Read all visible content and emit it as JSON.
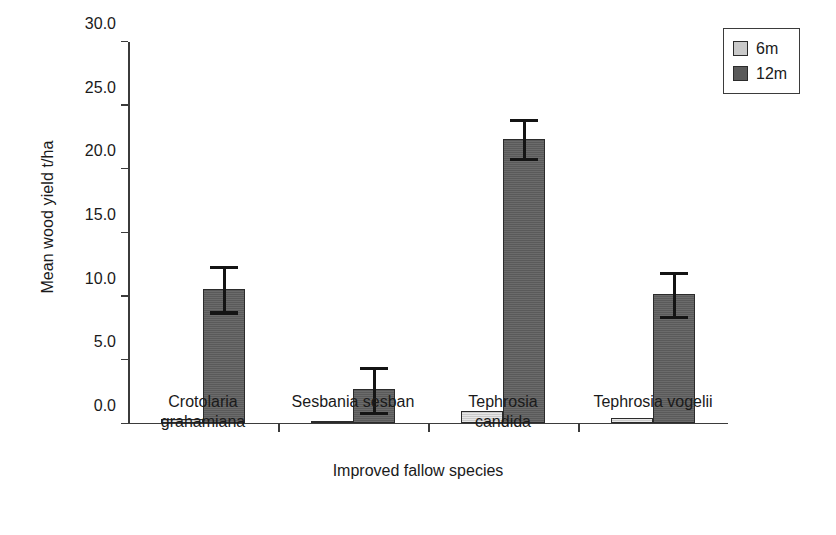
{
  "chart_data": {
    "type": "bar",
    "title": "",
    "xlabel": "Improved fallow species",
    "ylabel": "Mean wood yield t/ha",
    "categories": [
      "Crotolaria grahamiana",
      "Sesbania sesban",
      "Tephrosia candida",
      "Tephrosia vogelii"
    ],
    "category_lines": [
      [
        "Crotolaria",
        "grahamiana"
      ],
      [
        "Sesbania sesban"
      ],
      [
        "Tephrosia",
        "candida"
      ],
      [
        "Tephrosia vogelii"
      ]
    ],
    "series": [
      {
        "name": "6m",
        "color": "#c9c9c9",
        "values": [
          0.3,
          0.1,
          0.9,
          0.35
        ],
        "errors": [
          null,
          null,
          null,
          null
        ]
      },
      {
        "name": "12m",
        "color": "#5a5a5a",
        "values": [
          10.5,
          2.6,
          22.3,
          10.1
        ],
        "errors": [
          1.8,
          1.8,
          1.55,
          1.75
        ]
      }
    ],
    "ylim": [
      0.0,
      30.0
    ],
    "yticks": [
      0.0,
      5.0,
      10.0,
      15.0,
      20.0,
      25.0,
      30.0
    ],
    "ytick_labels": [
      "0.0",
      "5.0",
      "10.0",
      "15.0",
      "20.0",
      "25.0",
      "30.0"
    ],
    "grid": false,
    "legend_position": "top-right",
    "legend_entries": [
      "6m",
      "12m"
    ]
  }
}
